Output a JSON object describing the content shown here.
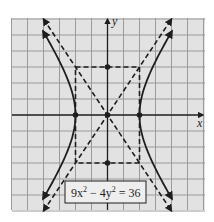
{
  "figure": {
    "equation_parts": {
      "a": "9x",
      "exp1": "2",
      "mid": " − 4y",
      "exp2": "2",
      "end": " = 36"
    },
    "axes": {
      "x_label": "x",
      "y_label": "y"
    },
    "colors": {
      "background": "#e2e2e2",
      "grid": "#9a9a9a",
      "curve": "#1e1e1e",
      "label_bg": "#eeeeee"
    },
    "grid": {
      "xmin": -6,
      "xmax": 6,
      "ymin": -6,
      "ymax": 6,
      "step": 1
    },
    "hyperbola": {
      "a": 2,
      "b": 3,
      "orientation": "horizontal"
    },
    "vertices": [
      [
        -2,
        0
      ],
      [
        2,
        0
      ]
    ],
    "co_vertices": [
      [
        0,
        3
      ],
      [
        0,
        -3
      ]
    ],
    "center": [
      0,
      0
    ],
    "asymptotes": [
      "y = 1.5x",
      "y = -1.5x"
    ],
    "box": {
      "x": [
        -2,
        2
      ],
      "y": [
        -3,
        3
      ]
    }
  }
}
